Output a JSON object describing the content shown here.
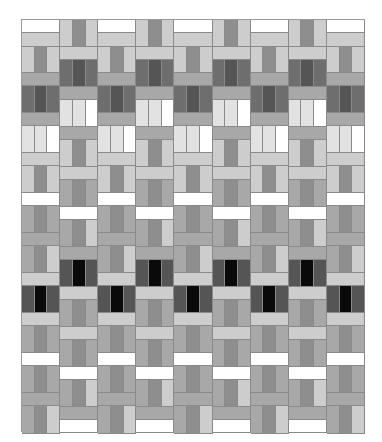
{
  "palette": {
    "white": "#ffffff",
    "pale": "#e2e2e2",
    "light": "#cdcdcd",
    "mid": "#a8a8a8",
    "mid2": "#8e8e8e",
    "dark": "#6e6e6e",
    "darker": "#555555",
    "black": "#0a0a0a"
  },
  "quilt": {
    "columns": 9,
    "even_column": [
      {
        "t": "h",
        "h": 13,
        "c": "white"
      },
      {
        "t": "h",
        "h": 14,
        "c": "light"
      },
      {
        "t": "v",
        "h": 26,
        "c": [
          "light",
          "mid2",
          "light"
        ]
      },
      {
        "t": "h",
        "h": 13,
        "c": "mid"
      },
      {
        "t": "v",
        "h": 27,
        "c": [
          "dark",
          "darker",
          "dark"
        ]
      },
      {
        "t": "h",
        "h": 13,
        "c": "mid"
      },
      {
        "t": "v",
        "h": 27,
        "c": [
          "pale",
          "pale",
          "white"
        ]
      },
      {
        "t": "h",
        "h": 13,
        "c": "light"
      },
      {
        "t": "v",
        "h": 27,
        "c": [
          "light",
          "mid2",
          "light"
        ]
      },
      {
        "t": "h",
        "h": 13,
        "c": "white"
      },
      {
        "t": "v",
        "h": 27,
        "c": [
          "mid",
          "mid2",
          "mid"
        ]
      },
      {
        "t": "h",
        "h": 13,
        "c": "mid"
      },
      {
        "t": "v",
        "h": 27,
        "c": [
          "mid",
          "mid2",
          "light"
        ]
      },
      {
        "t": "h",
        "h": 13,
        "c": "light"
      },
      {
        "t": "v",
        "h": 27,
        "c": [
          "darker",
          "black",
          "darker"
        ]
      },
      {
        "t": "h",
        "h": 13,
        "c": "light"
      },
      {
        "t": "v",
        "h": 27,
        "c": [
          "mid",
          "mid2",
          "mid"
        ]
      },
      {
        "t": "h",
        "h": 13,
        "c": "white"
      },
      {
        "t": "v",
        "h": 27,
        "c": [
          "mid",
          "mid2",
          "mid"
        ]
      },
      {
        "t": "h",
        "h": 13,
        "c": "mid"
      },
      {
        "t": "v",
        "h": 28,
        "c": [
          "mid",
          "mid2",
          "light"
        ]
      }
    ],
    "odd_column": [
      {
        "t": "v",
        "h": 27,
        "c": [
          "light",
          "mid2",
          "light"
        ]
      },
      {
        "t": "h",
        "h": 13,
        "c": "light"
      },
      {
        "t": "v",
        "h": 27,
        "c": [
          "dark",
          "darker",
          "dark"
        ]
      },
      {
        "t": "h",
        "h": 13,
        "c": "mid"
      },
      {
        "t": "v",
        "h": 27,
        "c": [
          "pale",
          "pale",
          "white"
        ]
      },
      {
        "t": "h",
        "h": 13,
        "c": "mid"
      },
      {
        "t": "v",
        "h": 27,
        "c": [
          "light",
          "mid2",
          "light"
        ]
      },
      {
        "t": "h",
        "h": 13,
        "c": "light"
      },
      {
        "t": "v",
        "h": 27,
        "c": [
          "mid",
          "mid2",
          "mid"
        ]
      },
      {
        "t": "h",
        "h": 13,
        "c": "white"
      },
      {
        "t": "v",
        "h": 27,
        "c": [
          "mid",
          "mid2",
          "light"
        ]
      },
      {
        "t": "h",
        "h": 13,
        "c": "mid"
      },
      {
        "t": "v",
        "h": 27,
        "c": [
          "darker",
          "black",
          "darker"
        ]
      },
      {
        "t": "h",
        "h": 13,
        "c": "light"
      },
      {
        "t": "v",
        "h": 27,
        "c": [
          "mid",
          "mid2",
          "mid"
        ]
      },
      {
        "t": "h",
        "h": 13,
        "c": "light"
      },
      {
        "t": "v",
        "h": 27,
        "c": [
          "mid",
          "mid2",
          "mid"
        ]
      },
      {
        "t": "h",
        "h": 13,
        "c": "white"
      },
      {
        "t": "v",
        "h": 27,
        "c": [
          "mid",
          "mid2",
          "light"
        ]
      },
      {
        "t": "h",
        "h": 13,
        "c": "mid"
      },
      {
        "t": "h",
        "h": 13,
        "c": "white"
      }
    ]
  }
}
